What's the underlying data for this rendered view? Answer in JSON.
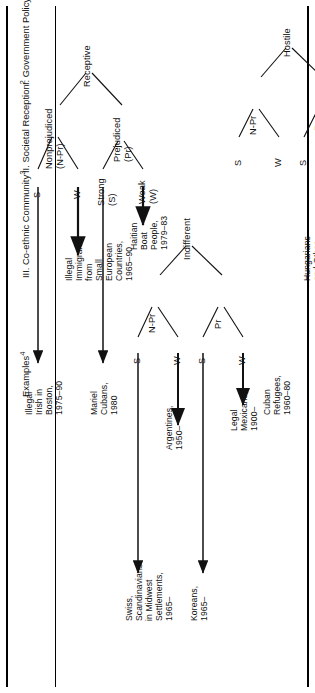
{
  "figure": {
    "type": "tree-diagram",
    "orientation": "rotated-90-ccw",
    "row_labels": [
      {
        "id": "government-policy",
        "text": "I. Government Policy",
        "note": "1"
      },
      {
        "id": "societal-reception",
        "text": "II. Societal Reception",
        "note": "2"
      },
      {
        "id": "coethnic-community",
        "text": "III. Co-ethnic Community",
        "note": "3"
      },
      {
        "id": "examples",
        "text": "Examples",
        "note": "4"
      }
    ],
    "level1": [
      {
        "id": "receptive",
        "label": "Receptive"
      },
      {
        "id": "indifferent",
        "label": "Indifferent"
      },
      {
        "id": "hostile",
        "label": "Hostile"
      }
    ],
    "level2": [
      {
        "id": "receptive-prejudiced",
        "label": "Prejudiced\n(Pr)",
        "parent": "receptive"
      },
      {
        "id": "receptive-nonprejudiced",
        "label": "Nonprejudiced\n(N-Pr)",
        "parent": "receptive"
      },
      {
        "id": "indifferent-prejudiced",
        "label": "Pr",
        "parent": "indifferent"
      },
      {
        "id": "indifferent-nonprejudiced",
        "label": "N-Pr",
        "parent": "indifferent"
      },
      {
        "id": "hostile-prejudiced",
        "label": "Pr",
        "parent": "hostile"
      },
      {
        "id": "hostile-nonprejudiced",
        "label": "N-Pr",
        "parent": "hostile"
      }
    ],
    "level3": [
      {
        "id": "rec-pr-weak",
        "label": "Weak\n(W)"
      },
      {
        "id": "rec-pr-strong",
        "label": "Strong\n(S)"
      },
      {
        "id": "rec-npr-weak",
        "label": "W"
      },
      {
        "id": "rec-npr-strong",
        "label": "S"
      },
      {
        "id": "ind-pr-weak",
        "label": "W"
      },
      {
        "id": "ind-pr-strong",
        "label": "S"
      },
      {
        "id": "ind-npr-weak",
        "label": "W"
      },
      {
        "id": "ind-npr-strong",
        "label": "S"
      },
      {
        "id": "hos-pr-weak",
        "label": "W"
      },
      {
        "id": "hos-pr-strong",
        "label": "S"
      },
      {
        "id": "hos-npr-weak",
        "label": "W"
      },
      {
        "id": "hos-npr-strong",
        "label": "S"
      }
    ],
    "examples": [
      {
        "id": "ex-cambodian-hmong",
        "text": "Cambodian,\nHmong\nRefugees,\n1975–90"
      },
      {
        "id": "ex-chinese-vietnamese",
        "text": "Chinese,\nVietnamese\nRefugees,\n1975–90"
      },
      {
        "id": "ex-hungarians",
        "text": "Hungarians\nand Other\nSmall East\nEuropean\nRefugee\nGroups,\n1956–90"
      },
      {
        "id": "ex-cuban-refugees",
        "text": "Cuban\nRefugees,\n1960–80"
      },
      {
        "id": "ex-legal-mexicans",
        "text": "Legal\nMexicans,\n1900–"
      },
      {
        "id": "ex-koreans",
        "text": "Koreans,\n1965–"
      },
      {
        "id": "ex-argentines",
        "text": "Argentines,\n1950–"
      },
      {
        "id": "ex-swiss-scandinavians",
        "text": "Swiss,\nScandinavians\nin Midwest\nSettlements,\n1965–"
      },
      {
        "id": "ex-haitian-boat-people",
        "text": "Haitian\nBoat\nPeople,\n1979–83"
      },
      {
        "id": "ex-mariel-cubans",
        "text": "Mariel\nCubans,\n1980"
      },
      {
        "id": "ex-illegal-immigrants-small-euro",
        "text": "Illegal\nImmigrants\nfrom\nSmall\nEuropean\nCountries,\n1965–90"
      },
      {
        "id": "ex-illegal-irish-boston",
        "text": "Illegal\nIrish in\nBoston,\n1975–90"
      }
    ],
    "colors": {
      "ink": "#111111",
      "background": "#ffffff"
    }
  }
}
